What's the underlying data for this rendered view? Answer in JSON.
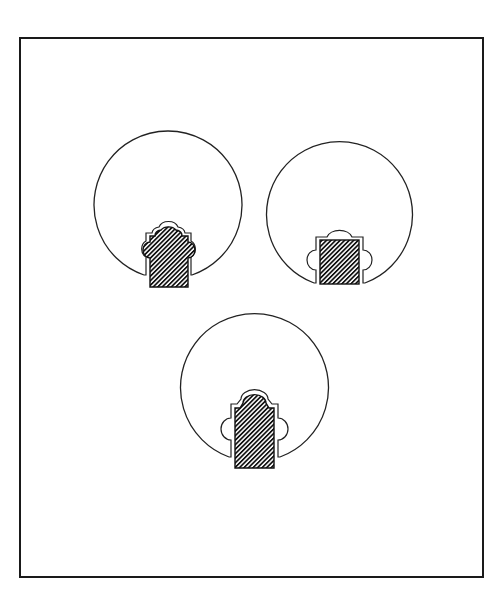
{
  "figure": {
    "background": "#ffffff",
    "frame": {
      "x": 20,
      "y": 38,
      "width": 463,
      "height": 539,
      "stroke": "#1a1a1a"
    },
    "line_color": "#222222",
    "hatch_color": "#111111",
    "items": [
      {
        "name": "circle-keyhole-1",
        "circle": {
          "cx": 168,
          "cy": 205,
          "r": 74
        },
        "insert_shape": "scalloped-top-three-lobes",
        "insert_rect": {
          "x": 150,
          "y": 234,
          "w": 38,
          "h": 53
        }
      },
      {
        "name": "circle-keyhole-2",
        "circle": {
          "cx": 340,
          "cy": 214,
          "r": 73
        },
        "insert_shape": "square-with-three-outer-lobes",
        "insert_rect": {
          "x": 320,
          "y": 240,
          "w": 39,
          "h": 44
        }
      },
      {
        "name": "circle-keyhole-3",
        "circle": {
          "cx": 254,
          "cy": 388,
          "r": 74
        },
        "insert_shape": "tall-rect-with-arched-top",
        "insert_rect": {
          "x": 235,
          "y": 408,
          "w": 39,
          "h": 60
        }
      }
    ]
  }
}
